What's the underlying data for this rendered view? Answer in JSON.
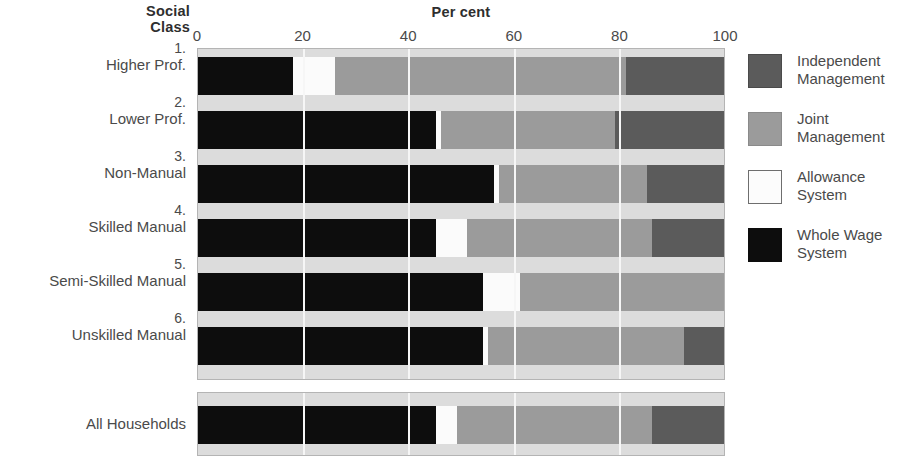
{
  "headings": {
    "social_class_line1": "Social",
    "social_class_line2": "Class",
    "axis_title": "Per cent"
  },
  "legend": {
    "items": [
      {
        "key": "indep",
        "line1": "Independent",
        "line2": "Management",
        "color": "#5b5b5b",
        "swatch": "indep-swatch"
      },
      {
        "key": "joint",
        "line1": "Joint",
        "line2": "Management",
        "color": "#9b9b9b",
        "swatch": "joint-swatch"
      },
      {
        "key": "allow",
        "line1": "Allowance",
        "line2": "System",
        "color": "#fcfcfc",
        "swatch": "allowance-swatch"
      },
      {
        "key": "whole",
        "line1": "Whole Wage",
        "line2": "System",
        "color": "#0d0d0d",
        "swatch": "whole-wage-swatch"
      }
    ]
  },
  "chart_data": {
    "type": "bar",
    "orientation": "horizontal",
    "stacked": true,
    "title": "",
    "xlabel": "Per cent",
    "ylabel": "Social Class",
    "xlim": [
      0,
      100
    ],
    "xticks": [
      0,
      20,
      40,
      60,
      80,
      100
    ],
    "xtick_labels": [
      "0",
      "20",
      "40",
      "60",
      "80",
      "100"
    ],
    "grid": true,
    "grid_axis": "x",
    "legend_position": "right",
    "series": [
      {
        "name": "Whole Wage System",
        "color": "#0d0d0d",
        "values": [
          18,
          45,
          56,
          45,
          54,
          54,
          45
        ]
      },
      {
        "name": "Allowance System",
        "color": "#fcfcfc",
        "values": [
          8,
          1,
          1,
          6,
          7,
          1,
          4
        ]
      },
      {
        "name": "Joint Management",
        "color": "#9b9b9b",
        "values": [
          55,
          33,
          28,
          35,
          39,
          37,
          37
        ]
      },
      {
        "name": "Independent Management",
        "color": "#5b5b5b",
        "values": [
          19,
          21,
          15,
          14,
          0,
          8,
          14
        ]
      }
    ],
    "categories": [
      "1. Higher Prof.",
      "2. Lower Prof.",
      "3. Non-Manual",
      "4. Skilled Manual",
      "5. Semi-Skilled Manual",
      "6. Unskilled Manual",
      "All Households"
    ],
    "rows": [
      {
        "num": "1.",
        "label": "Higher Prof.",
        "whole": 18,
        "allowance": 8,
        "joint": 55,
        "independent": 19
      },
      {
        "num": "2.",
        "label": "Lower Prof.",
        "whole": 45,
        "allowance": 1,
        "joint": 33,
        "independent": 21
      },
      {
        "num": "3.",
        "label": "Non-Manual",
        "whole": 56,
        "allowance": 1,
        "joint": 28,
        "independent": 15
      },
      {
        "num": "4.",
        "label": "Skilled Manual",
        "whole": 45,
        "allowance": 6,
        "joint": 35,
        "independent": 14
      },
      {
        "num": "5.",
        "label": "Semi-Skilled Manual",
        "whole": 54,
        "allowance": 7,
        "joint": 39,
        "independent": 0
      },
      {
        "num": "6.",
        "label": "Unskilled Manual",
        "whole": 54,
        "allowance": 1,
        "joint": 37,
        "independent": 8
      }
    ],
    "total_row": {
      "num": "",
      "label": "All Households",
      "whole": 45,
      "allowance": 4,
      "joint": 37,
      "independent": 14
    }
  }
}
